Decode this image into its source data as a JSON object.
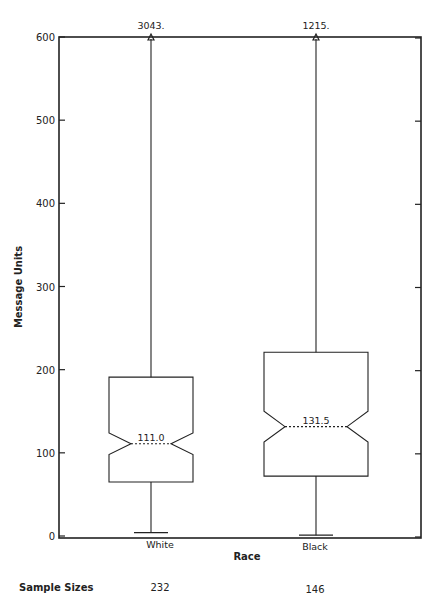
{
  "chart_data": {
    "type": "boxplot",
    "title": "",
    "xlabel": "Race",
    "ylabel": "Message Units",
    "ylim": [
      0,
      600
    ],
    "yticks": [
      0,
      100,
      200,
      300,
      400,
      500,
      600
    ],
    "ytick_labels": [
      "0",
      "100",
      "200",
      "300",
      "400",
      "500",
      "600"
    ],
    "grid": false,
    "notched": true,
    "categories": [
      "White",
      "Black"
    ],
    "series": [
      {
        "name": "White",
        "median": 111.0,
        "median_label": "111.0",
        "q1": 65,
        "q3": 191,
        "notch_low": 98,
        "notch_high": 124,
        "whisker_low": 4,
        "whisker_high": 3043,
        "whisker_high_label": "3043.",
        "whisker_high_offscale": true,
        "sample_size": 232
      },
      {
        "name": "Black",
        "median": 131.5,
        "median_label": "131.5",
        "q1": 72,
        "q3": 221,
        "notch_low": 113,
        "notch_high": 150,
        "whisker_low": 1,
        "whisker_high": 1215,
        "whisker_high_label": "1215.",
        "whisker_high_offscale": true,
        "sample_size": 146
      }
    ],
    "footer": {
      "label": "Sample Sizes",
      "values": [
        "232",
        "146"
      ]
    }
  }
}
